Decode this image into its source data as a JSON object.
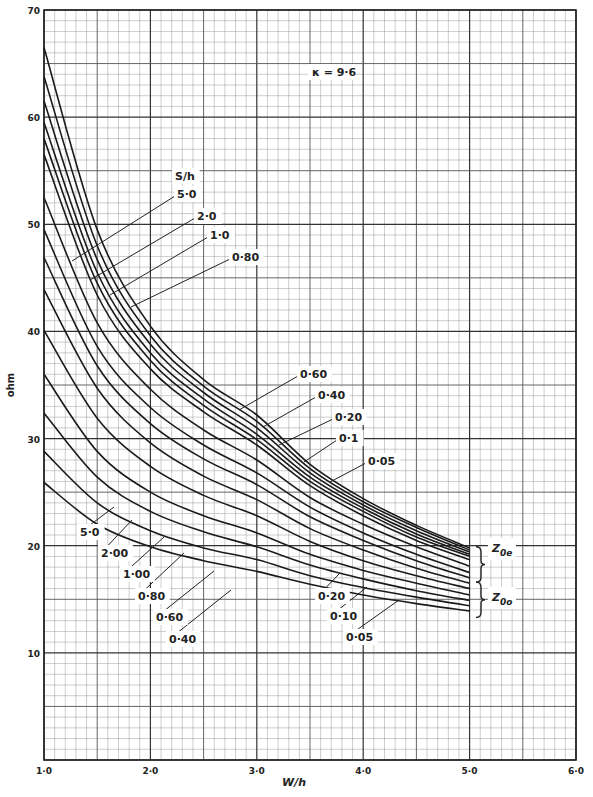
{
  "chart_data": {
    "type": "line",
    "title": "",
    "annotation": "κ = 9·6",
    "xlabel": "W/h",
    "ylabel": "ohm",
    "xlim": [
      1.0,
      6.0
    ],
    "ylim": [
      0,
      70
    ],
    "x_ticks": [
      "1·0",
      "2·0",
      "3·0",
      "4·0",
      "5·0",
      "6·0"
    ],
    "y_ticks": [
      "10",
      "20",
      "30",
      "40",
      "50",
      "60",
      "70"
    ],
    "grid": true,
    "legend_title": "S/h",
    "group_labels": [
      "Z0e",
      "Z0o"
    ],
    "x": [
      1.0,
      1.5,
      2.0,
      2.5,
      3.0,
      3.5,
      4.0,
      4.5,
      5.0
    ],
    "series": [
      {
        "name": "Z0e S/h=5.0",
        "group": "Z0e",
        "s_over_h": "5·0",
        "values": [
          66.5,
          49.5,
          40.5,
          35.5,
          32.2,
          27.6,
          24.4,
          21.9,
          19.8
        ]
      },
      {
        "name": "Z0e S/h=2.0",
        "group": "Z0e",
        "s_over_h": "2·0",
        "values": [
          63.8,
          48.0,
          39.6,
          34.9,
          31.6,
          27.2,
          24.1,
          21.7,
          19.6
        ]
      },
      {
        "name": "Z0e S/h=1.0",
        "group": "Z0e",
        "s_over_h": "1·0",
        "values": [
          61.5,
          46.7,
          38.8,
          34.3,
          31.0,
          26.8,
          23.8,
          21.4,
          19.4
        ]
      },
      {
        "name": "Z0e S/h=0.80",
        "group": "Z0e",
        "s_over_h": "0·80",
        "values": [
          59.5,
          45.5,
          38.0,
          33.7,
          30.4,
          26.4,
          23.5,
          21.1,
          19.2
        ]
      },
      {
        "name": "Z0e S/h=0.60",
        "group": "Z0e",
        "s_over_h": "0·60",
        "values": [
          58.0,
          44.5,
          37.3,
          33.1,
          29.9,
          26.0,
          23.2,
          20.8,
          19.0
        ]
      },
      {
        "name": "Z0e S/h=0.40",
        "group": "Z0e",
        "s_over_h": "0·40",
        "values": [
          56.5,
          43.4,
          36.5,
          32.5,
          29.4,
          25.6,
          22.8,
          20.5,
          18.7
        ]
      },
      {
        "name": "Z0e S/h=0.20",
        "group": "Z0e",
        "s_over_h": "0·20",
        "values": [
          52.5,
          40.8,
          34.6,
          30.8,
          28.0,
          24.5,
          22.0,
          19.9,
          18.1
        ]
      },
      {
        "name": "Z0e S/h=0.1",
        "group": "Z0e",
        "s_over_h": "0·1",
        "values": [
          49.5,
          38.6,
          32.9,
          29.4,
          26.8,
          23.6,
          21.2,
          19.2,
          17.5
        ]
      },
      {
        "name": "Z0e S/h=0.05",
        "group": "Z0e",
        "s_over_h": "0·05",
        "values": [
          46.9,
          36.8,
          31.4,
          28.1,
          25.7,
          22.7,
          20.5,
          18.6,
          17.0
        ]
      },
      {
        "name": "Z0o S/h=5.0",
        "group": "Z0o",
        "s_over_h": "5·0",
        "values": [
          43.9,
          34.7,
          29.6,
          26.5,
          24.3,
          21.6,
          19.6,
          17.9,
          16.5
        ]
      },
      {
        "name": "Z0o S/h=2.00",
        "group": "Z0o",
        "s_over_h": "2·00",
        "values": [
          40.1,
          31.9,
          27.4,
          24.7,
          22.8,
          20.4,
          18.6,
          17.2,
          16.0
        ]
      },
      {
        "name": "Z0o S/h=1.00",
        "group": "Z0o",
        "s_over_h": "1·00",
        "values": [
          36.0,
          28.8,
          25.0,
          22.8,
          21.2,
          19.2,
          17.7,
          16.5,
          15.4
        ]
      },
      {
        "name": "Z0o S/h=0.80",
        "group": "Z0o",
        "s_over_h": "0·80",
        "values": [
          32.4,
          26.4,
          23.2,
          21.3,
          19.9,
          18.2,
          16.9,
          15.8,
          14.9
        ]
      },
      {
        "name": "Z0o S/h=0.60",
        "group": "Z0o",
        "s_over_h": "0·60",
        "values": [
          28.8,
          24.0,
          21.4,
          19.8,
          18.7,
          17.2,
          16.1,
          15.2,
          14.4
        ]
      },
      {
        "name": "Z0o S/h=0.40",
        "group": "Z0o",
        "s_over_h": "0·40",
        "values": [
          25.9,
          22.0,
          19.9,
          18.6,
          17.6,
          16.4,
          15.4,
          14.6,
          13.9
        ]
      }
    ],
    "labels_upper": [
      {
        "text": "S/h",
        "x": 175,
        "y": 180
      },
      {
        "text": "5·0",
        "x": 177,
        "y": 198,
        "line_to": [
          72,
          261
        ]
      },
      {
        "text": "2·0",
        "x": 197,
        "y": 220,
        "line_to": [
          90,
          280
        ]
      },
      {
        "text": "1·0",
        "x": 210,
        "y": 239,
        "line_to": [
          110,
          295
        ]
      },
      {
        "text": "0·80",
        "x": 232,
        "y": 261,
        "line_to": [
          131,
          307
        ]
      }
    ],
    "labels_mid": [
      {
        "text": "0·60",
        "x": 300,
        "y": 378,
        "line_to": [
          239,
          410
        ]
      },
      {
        "text": "0·40",
        "x": 318,
        "y": 399,
        "line_to": [
          263,
          427
        ]
      },
      {
        "text": "0·20",
        "x": 335,
        "y": 421,
        "line_to": [
          279,
          445
        ]
      },
      {
        "text": "0·1",
        "x": 339,
        "y": 442,
        "line_to": [
          304,
          462
        ]
      },
      {
        "text": "0·05",
        "x": 368,
        "y": 465,
        "line_to": [
          330,
          482
        ]
      }
    ],
    "labels_lower": [
      {
        "text": "5·0",
        "x": 80,
        "y": 536,
        "line_to": [
          114,
          507
        ]
      },
      {
        "text": "2·00",
        "x": 101,
        "y": 557,
        "line_to": [
          132,
          520
        ]
      },
      {
        "text": "1·00",
        "x": 123,
        "y": 578,
        "line_to": [
          164,
          537
        ]
      },
      {
        "text": "0·80",
        "x": 138,
        "y": 600,
        "line_to": [
          184,
          553
        ]
      },
      {
        "text": "0·60",
        "x": 156,
        "y": 621,
        "line_to": [
          214,
          571
        ]
      },
      {
        "text": "0·40",
        "x": 169,
        "y": 643,
        "line_to": [
          231,
          590
        ]
      },
      {
        "text": "0·20",
        "x": 318,
        "y": 600,
        "line_to": [
          340,
          573
        ]
      },
      {
        "text": "0·10",
        "x": 330,
        "y": 620,
        "line_to": [
          367,
          587
        ]
      },
      {
        "text": "0·05",
        "x": 346,
        "y": 641,
        "line_to": [
          399,
          600
        ]
      }
    ],
    "group_label_positions": [
      {
        "key": "Z0e",
        "x": 496,
        "y": 552
      },
      {
        "key": "Z0o",
        "x": 496,
        "y": 601
      }
    ]
  }
}
